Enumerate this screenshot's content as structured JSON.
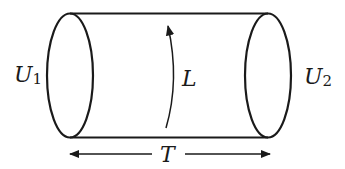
{
  "diagram": {
    "type": "cylinder-cobordism",
    "labels": {
      "left_boundary": "U",
      "left_boundary_sub": "1",
      "right_boundary": "U",
      "right_boundary_sub": "2",
      "loop": "L",
      "length": "T"
    },
    "colors": {
      "stroke": "#1a1a1a",
      "background": "#ffffff"
    }
  }
}
